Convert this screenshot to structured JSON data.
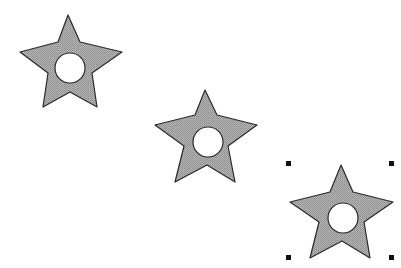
{
  "canvas": {
    "background": "#ffffff",
    "width": 401,
    "height": 268
  },
  "style": {
    "star_fill": "#a6a6a6",
    "star_stroke": "#2a2a2a",
    "hole_fill": "#ffffff",
    "handle_color": "#111111"
  },
  "shapes": [
    {
      "id": "star-1",
      "type": "star-with-hole",
      "points": "68,15 80,42 122,52 92,73 97,107 70,92 43,107 48,73 20,52 58,42",
      "hole": {
        "cx": 70,
        "cy": 68,
        "r": 15
      },
      "selected": false
    },
    {
      "id": "star-2",
      "type": "star-with-hole",
      "points": "205,90 217,115 257,125 228,146 235,182 207,165 175,182 184,146 155,125 195,115",
      "hole": {
        "cx": 208,
        "cy": 142,
        "r": 15
      },
      "selected": false
    },
    {
      "id": "star-3",
      "type": "star-with-hole",
      "points": "341,165 353,192 393,202 364,222 370,258 342,241 310,258 319,222 290,202 330,192",
      "hole": {
        "cx": 343,
        "cy": 218,
        "r": 15
      },
      "selected": true
    }
  ],
  "selection": {
    "handles": [
      {
        "x": 286,
        "y": 161
      },
      {
        "x": 389,
        "y": 161
      },
      {
        "x": 286,
        "y": 255
      },
      {
        "x": 389,
        "y": 255
      }
    ],
    "size": 5
  }
}
